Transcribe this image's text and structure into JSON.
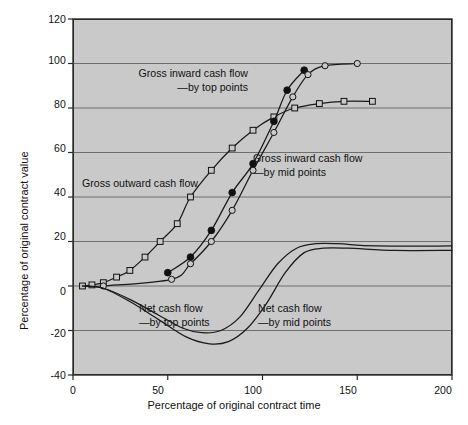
{
  "chart_data": {
    "type": "line",
    "title": "",
    "xlabel": "Percentage of original contract time",
    "ylabel": "Percentage of original contract value",
    "xlim": [
      0,
      200
    ],
    "ylim": [
      -40,
      120
    ],
    "xticks": [
      "0",
      "50",
      "100",
      "150",
      "200"
    ],
    "xtick_values": [
      0,
      50,
      100,
      150,
      200
    ],
    "yticks": [
      "120",
      "100",
      "80",
      "60",
      "40",
      "20",
      "0",
      "-20",
      "-40"
    ],
    "ytick_values": [
      120,
      100,
      80,
      60,
      40,
      20,
      0,
      -20,
      -40
    ],
    "grid": "horizontal gridlines at 100, 80, 60, 40, 20, 0, -20",
    "legend_position": "inline annotations on plot",
    "series": [
      {
        "name": "Gross outward cash flow",
        "marker": "open-square",
        "points": [
          {
            "x": 5,
            "y": 0
          },
          {
            "x": 10,
            "y": 0.5
          },
          {
            "x": 16,
            "y": 1.5
          },
          {
            "x": 23,
            "y": 4
          },
          {
            "x": 30,
            "y": 7
          },
          {
            "x": 38,
            "y": 13
          },
          {
            "x": 46,
            "y": 20
          },
          {
            "x": 55,
            "y": 28
          },
          {
            "x": 62,
            "y": 40
          },
          {
            "x": 73,
            "y": 52
          },
          {
            "x": 84,
            "y": 62
          },
          {
            "x": 95,
            "y": 70
          },
          {
            "x": 106,
            "y": 76
          },
          {
            "x": 117,
            "y": 80
          },
          {
            "x": 130,
            "y": 82
          },
          {
            "x": 143,
            "y": 83
          },
          {
            "x": 158,
            "y": 83
          }
        ]
      },
      {
        "name": "Gross inward cash flow —by top points",
        "marker": "filled-circle",
        "points": [
          {
            "x": 50,
            "y": 6
          },
          {
            "x": 62,
            "y": 13
          },
          {
            "x": 73,
            "y": 25
          },
          {
            "x": 84,
            "y": 42
          },
          {
            "x": 95,
            "y": 55
          },
          {
            "x": 106,
            "y": 74
          },
          {
            "x": 113,
            "y": 88
          },
          {
            "x": 122,
            "y": 97
          }
        ]
      },
      {
        "name": "Gross inward cash flow —by mid points",
        "marker": "open-circle",
        "points": [
          {
            "x": 16,
            "y": 0
          },
          {
            "x": 52,
            "y": 3
          },
          {
            "x": 62,
            "y": 10
          },
          {
            "x": 73,
            "y": 20
          },
          {
            "x": 84,
            "y": 34
          },
          {
            "x": 95,
            "y": 52
          },
          {
            "x": 106,
            "y": 69
          },
          {
            "x": 116,
            "y": 85
          },
          {
            "x": 124,
            "y": 95
          },
          {
            "x": 133,
            "y": 99
          },
          {
            "x": 150,
            "y": 100
          }
        ]
      },
      {
        "name": "Net cash flow —by top points",
        "marker": "none",
        "points": [
          {
            "x": 5,
            "y": 0
          },
          {
            "x": 16,
            "y": -1
          },
          {
            "x": 30,
            "y": -6
          },
          {
            "x": 45,
            "y": -13
          },
          {
            "x": 58,
            "y": -19
          },
          {
            "x": 68,
            "y": -21
          },
          {
            "x": 78,
            "y": -20
          },
          {
            "x": 88,
            "y": -14
          },
          {
            "x": 98,
            "y": -2
          },
          {
            "x": 108,
            "y": 10
          },
          {
            "x": 118,
            "y": 17
          },
          {
            "x": 128,
            "y": 19
          },
          {
            "x": 140,
            "y": 19
          },
          {
            "x": 160,
            "y": 18
          },
          {
            "x": 200,
            "y": 18
          }
        ]
      },
      {
        "name": "Net cash flow —by mid points",
        "marker": "none",
        "points": [
          {
            "x": 5,
            "y": 0
          },
          {
            "x": 16,
            "y": -1
          },
          {
            "x": 30,
            "y": -7
          },
          {
            "x": 45,
            "y": -15
          },
          {
            "x": 60,
            "y": -23
          },
          {
            "x": 72,
            "y": -26
          },
          {
            "x": 82,
            "y": -25
          },
          {
            "x": 92,
            "y": -19
          },
          {
            "x": 102,
            "y": -8
          },
          {
            "x": 112,
            "y": 6
          },
          {
            "x": 122,
            "y": 15
          },
          {
            "x": 132,
            "y": 17
          },
          {
            "x": 145,
            "y": 17
          },
          {
            "x": 170,
            "y": 16
          },
          {
            "x": 200,
            "y": 16
          }
        ]
      }
    ],
    "annotations": [
      {
        "id": "a1",
        "line1": "Gross inward cash flow",
        "line2": "—by top points"
      },
      {
        "id": "a2",
        "line1": "Gross outward cash flow",
        "line2": ""
      },
      {
        "id": "a3",
        "line1": "Gross inward cash flow",
        "line2": "—by mid points"
      },
      {
        "id": "a4",
        "line1": "Net cash flow",
        "line2": "—by top points"
      },
      {
        "id": "a5",
        "line1": "Net cash flow",
        "line2": "—by mid points"
      }
    ],
    "colors": {
      "plot_background": "#c9c9c9",
      "page_background": "#ffffff",
      "line": "#1a1a1a",
      "grid": "#6e6e6e",
      "axis": "#2a2a2a",
      "text": "#111111"
    }
  }
}
